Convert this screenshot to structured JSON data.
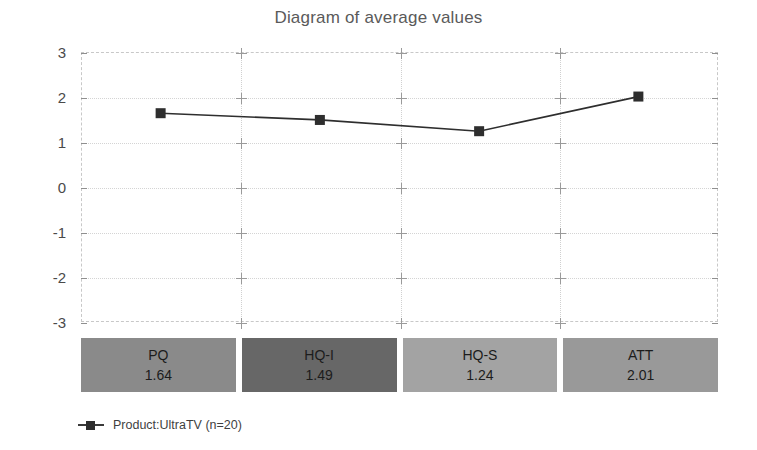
{
  "chart_data": {
    "type": "line",
    "title": "Diagram of average values",
    "xlabel": "",
    "ylabel": "",
    "ylim": [
      -3,
      3
    ],
    "yticks": [
      3,
      2,
      1,
      0,
      -1,
      -2,
      -3
    ],
    "grid": true,
    "legend_position": "bottom-left",
    "categories": [
      "PQ",
      "HQ-I",
      "HQ-S",
      "ATT"
    ],
    "series": [
      {
        "name": "Product:UltraTV (n=20)",
        "values": [
          1.64,
          1.49,
          1.24,
          2.01
        ],
        "color": "#2e2e2e",
        "marker": "square"
      }
    ],
    "value_table": {
      "rows": [
        {
          "label": "PQ",
          "value": "1.64",
          "color": "#8a8a8a"
        },
        {
          "label": "HQ-I",
          "value": "1.49",
          "color": "#676767"
        },
        {
          "label": "HQ-S",
          "value": "1.24",
          "color": "#a3a3a3"
        },
        {
          "label": "ATT",
          "value": "2.01",
          "color": "#999999"
        }
      ]
    }
  },
  "legend": {
    "entries": [
      {
        "label": "Product:UltraTV (n=20)"
      }
    ]
  },
  "axis": {
    "y_tick_labels": [
      "3",
      "2",
      "1",
      "0",
      "-1",
      "-2",
      "-3"
    ]
  },
  "colors": {
    "line": "#2e2e2e",
    "marker": "#2e2e2e",
    "grid": "#d4d4d4",
    "frame": "#c8c8c8",
    "title_text": "#5a5a5a",
    "axis_text": "#4a4a4a"
  }
}
